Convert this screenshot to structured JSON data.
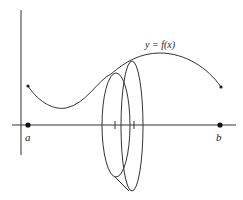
{
  "diagram": {
    "type": "solid-of-revolution",
    "curve_label": "y = f(x)",
    "left_endpoint_label": "a",
    "right_endpoint_label": "b",
    "stroke_color": "#333333",
    "background": "#ffffff",
    "elements": [
      "x-axis",
      "y-axis",
      "curve",
      "washer-ellipse-1",
      "washer-ellipse-2",
      "tick-marks"
    ]
  }
}
